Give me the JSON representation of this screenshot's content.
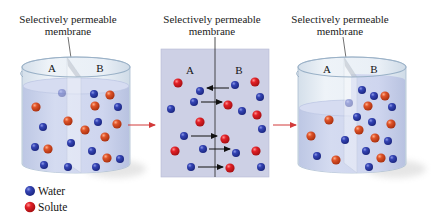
{
  "diagram": {
    "panels": [
      {
        "name": "initial-beaker",
        "membrane_label": {
          "line1": "Selectively permeable",
          "line2": "membrane"
        },
        "side_a": "A",
        "side_b": "B",
        "molecules": [
          {
            "x": 62,
            "y": 93,
            "type": "water",
            "faded": true
          },
          {
            "x": 94,
            "y": 94,
            "type": "water"
          },
          {
            "x": 110,
            "y": 95,
            "type": "solute"
          },
          {
            "x": 36,
            "y": 107,
            "type": "solute"
          },
          {
            "x": 95,
            "y": 106,
            "type": "solute"
          },
          {
            "x": 118,
            "y": 107,
            "type": "water"
          },
          {
            "x": 68,
            "y": 121,
            "type": "solute"
          },
          {
            "x": 98,
            "y": 122,
            "type": "water"
          },
          {
            "x": 117,
            "y": 124,
            "type": "solute"
          },
          {
            "x": 43,
            "y": 127,
            "type": "water"
          },
          {
            "x": 85,
            "y": 130,
            "type": "solute"
          },
          {
            "x": 105,
            "y": 137,
            "type": "solute"
          },
          {
            "x": 71,
            "y": 143,
            "type": "water"
          },
          {
            "x": 35,
            "y": 147,
            "type": "water"
          },
          {
            "x": 48,
            "y": 149,
            "type": "solute"
          },
          {
            "x": 92,
            "y": 151,
            "type": "water"
          },
          {
            "x": 107,
            "y": 158,
            "type": "solute"
          },
          {
            "x": 120,
            "y": 159,
            "type": "water"
          },
          {
            "x": 44,
            "y": 165,
            "type": "water"
          },
          {
            "x": 68,
            "y": 167,
            "type": "water"
          },
          {
            "x": 96,
            "y": 167,
            "type": "water"
          }
        ]
      },
      {
        "name": "membrane-closeup",
        "membrane_label": {
          "line1": "Selectively permeable",
          "line2": "membrane"
        },
        "side_a": "A",
        "side_b": "B",
        "molecules": [
          {
            "x": 178,
            "y": 83,
            "type": "solute"
          },
          {
            "x": 200,
            "y": 91,
            "type": "water"
          },
          {
            "x": 235,
            "y": 85,
            "type": "water"
          },
          {
            "x": 255,
            "y": 82,
            "type": "solute"
          },
          {
            "x": 194,
            "y": 102,
            "type": "water"
          },
          {
            "x": 228,
            "y": 105,
            "type": "solute"
          },
          {
            "x": 260,
            "y": 97,
            "type": "water"
          },
          {
            "x": 171,
            "y": 109,
            "type": "water"
          },
          {
            "x": 242,
            "y": 111,
            "type": "water"
          },
          {
            "x": 257,
            "y": 115,
            "type": "solute"
          },
          {
            "x": 200,
            "y": 122,
            "type": "solute"
          },
          {
            "x": 262,
            "y": 129,
            "type": "water"
          },
          {
            "x": 184,
            "y": 136,
            "type": "water"
          },
          {
            "x": 225,
            "y": 139,
            "type": "solute"
          },
          {
            "x": 175,
            "y": 151,
            "type": "solute"
          },
          {
            "x": 203,
            "y": 149,
            "type": "water"
          },
          {
            "x": 236,
            "y": 153,
            "type": "water"
          },
          {
            "x": 256,
            "y": 151,
            "type": "solute"
          },
          {
            "x": 191,
            "y": 167,
            "type": "water"
          },
          {
            "x": 230,
            "y": 168,
            "type": "solute"
          },
          {
            "x": 261,
            "y": 167,
            "type": "water"
          }
        ],
        "flow_arrows": [
          {
            "x1": 229,
            "x2": 207,
            "y": 88
          },
          {
            "x1": 201,
            "x2": 222,
            "y": 102
          },
          {
            "x1": 191,
            "x2": 217,
            "y": 136
          },
          {
            "x1": 209,
            "x2": 230,
            "y": 149
          },
          {
            "x1": 198,
            "x2": 223,
            "y": 167
          }
        ]
      },
      {
        "name": "final-beaker",
        "membrane_label": {
          "line1": "Selectively permeable",
          "line2": "membrane"
        },
        "side_a": "A",
        "side_b": "B",
        "molecules": [
          {
            "x": 362,
            "y": 90,
            "type": "water"
          },
          {
            "x": 374,
            "y": 96,
            "type": "water"
          },
          {
            "x": 385,
            "y": 96,
            "type": "solute"
          },
          {
            "x": 349,
            "y": 103,
            "type": "water",
            "faded": true
          },
          {
            "x": 368,
            "y": 106,
            "type": "solute"
          },
          {
            "x": 392,
            "y": 107,
            "type": "water"
          },
          {
            "x": 357,
            "y": 117,
            "type": "water"
          },
          {
            "x": 329,
            "y": 120,
            "type": "solute"
          },
          {
            "x": 372,
            "y": 122,
            "type": "water"
          },
          {
            "x": 391,
            "y": 124,
            "type": "solute"
          },
          {
            "x": 359,
            "y": 130,
            "type": "solute"
          },
          {
            "x": 311,
            "y": 136,
            "type": "solute"
          },
          {
            "x": 375,
            "y": 138,
            "type": "solute"
          },
          {
            "x": 345,
            "y": 140,
            "type": "water"
          },
          {
            "x": 388,
            "y": 141,
            "type": "water"
          },
          {
            "x": 366,
            "y": 151,
            "type": "water"
          },
          {
            "x": 317,
            "y": 156,
            "type": "water"
          },
          {
            "x": 336,
            "y": 160,
            "type": "solute"
          },
          {
            "x": 381,
            "y": 158,
            "type": "solute"
          },
          {
            "x": 393,
            "y": 159,
            "type": "water"
          },
          {
            "x": 369,
            "y": 167,
            "type": "water"
          }
        ]
      }
    ],
    "transition_arrows": [
      {
        "x1": 128,
        "x2": 155,
        "y": 125
      },
      {
        "x1": 273,
        "x2": 296,
        "y": 125
      }
    ],
    "legend": [
      {
        "label": "Water",
        "type": "water"
      },
      {
        "label": "Solute",
        "type": "solute"
      }
    ]
  },
  "colors": {
    "water": "#2a3aa6",
    "solute": "#dc2a22",
    "liquid": "#c9d1ea",
    "closeup_panel": "#cdd0e5",
    "glass": "#e6edf4",
    "transition_arrow": "#d23a3a",
    "flow_arrow": "#111111"
  }
}
